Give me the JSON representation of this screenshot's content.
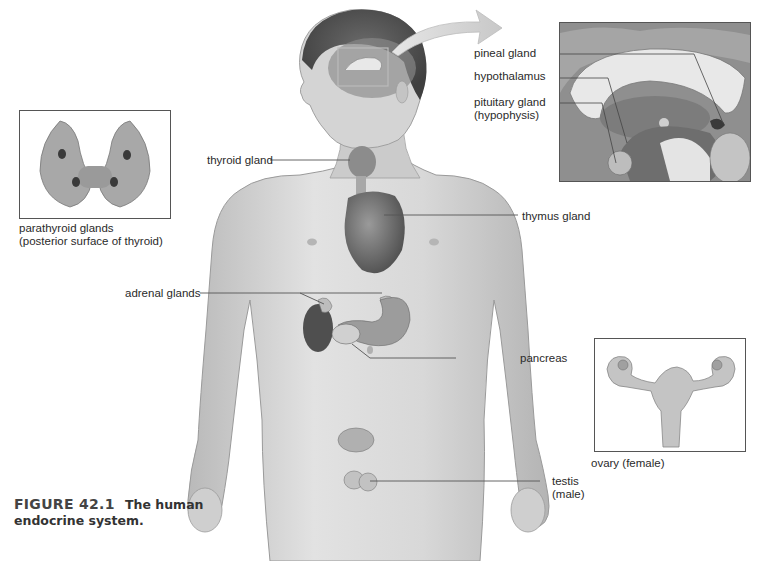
{
  "figure": {
    "number": "FIGURE 42.1",
    "title": "The human endocrine system.",
    "title_line1": "The human",
    "title_line2": "endocrine system."
  },
  "labels": {
    "pineal": "pineal gland",
    "hypothalamus": "hypothalamus",
    "pituitary_1": "pituitary gland",
    "pituitary_2": "(hypophysis)",
    "thyroid": "thyroid gland",
    "thymus": "thymus gland",
    "adrenal": "adrenal glands",
    "pancreas": "pancreas",
    "testis_1": "testis",
    "testis_2": "(male)",
    "parathyroid_1": "parathyroid glands",
    "parathyroid_2": "(posterior surface of thyroid)",
    "ovary": "ovary (female)"
  },
  "insets": [
    "brain-cross-section",
    "parathyroid",
    "ovary-uterus"
  ],
  "colors": {
    "skin": "#cfcfcf",
    "outline": "#8a8a8a",
    "leader": "#555555",
    "organ_dark": "#5a5a5a"
  }
}
